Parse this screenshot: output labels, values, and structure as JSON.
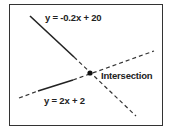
{
  "diagram": {
    "lines": [
      {
        "equation": "y = -0.2x + 20",
        "style": "solid-then-dashed"
      },
      {
        "equation": "y = 2x + 2",
        "style": "solid-then-dashed"
      }
    ],
    "point": {
      "label": "Intersection"
    },
    "colors": {
      "line": "#222222",
      "border": "#333333",
      "background": "#ffffff"
    }
  }
}
